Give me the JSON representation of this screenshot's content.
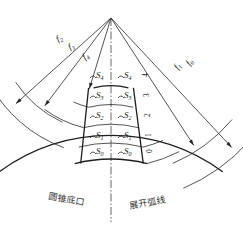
{
  "diagram": {
    "type": "cone development / unfolded arc layout",
    "apex": "O",
    "radius_labels": [
      {
        "name": "f",
        "sub": "0"
      },
      {
        "name": "f",
        "sub": "1"
      },
      {
        "name": "f",
        "sub": "2"
      },
      {
        "name": "f",
        "sub": "3"
      },
      {
        "name": "f",
        "sub": "4"
      }
    ],
    "arc_labels": {
      "left": [
        {
          "name": "S",
          "sub": "4"
        },
        {
          "name": "S",
          "sub": "3"
        },
        {
          "name": "S",
          "sub": "2"
        },
        {
          "name": "S",
          "sub": "1"
        },
        {
          "name": "S",
          "sub": "0"
        }
      ],
      "right": [
        {
          "name": "S",
          "sub": "4"
        },
        {
          "name": "S",
          "sub": "3"
        },
        {
          "name": "S",
          "sub": "2"
        },
        {
          "name": "S",
          "sub": "1"
        },
        {
          "name": "S",
          "sub": "0"
        }
      ]
    },
    "row_numbers": [
      "4",
      "3",
      "2",
      "1",
      "0"
    ],
    "bottom_labels": {
      "left": "圆锥底口",
      "right": "展开弧线"
    }
  }
}
